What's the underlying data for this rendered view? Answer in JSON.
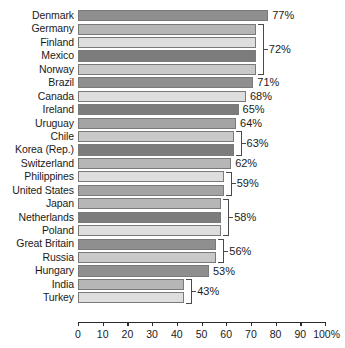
{
  "chart_data": {
    "type": "bar",
    "orientation": "horizontal",
    "title": "",
    "subtitle": "",
    "xlabel": "",
    "ylabel": "",
    "xlim": [
      0,
      100
    ],
    "grid": false,
    "legend": null,
    "unit": "%",
    "xticks": [
      0,
      10,
      20,
      30,
      40,
      50,
      60,
      70,
      80,
      90,
      100
    ],
    "xticklabels": [
      "0",
      "10",
      "20",
      "30",
      "40",
      "50",
      "60",
      "70",
      "80",
      "90",
      "100%"
    ],
    "categories": [
      "Denmark",
      "Germany",
      "Finland",
      "Mexico",
      "Norway",
      "Brazil",
      "Canada",
      "Ireland",
      "Uruguay",
      "Chile",
      "Korea (Rep.)",
      "Switzerland",
      "Philippines",
      "United States",
      "Japan",
      "Netherlands",
      "Poland",
      "Great Britain",
      "Russia",
      "Hungary",
      "India",
      "Turkey"
    ],
    "values": [
      77,
      72,
      72,
      72,
      72,
      71,
      68,
      65,
      64,
      63,
      63,
      62,
      59,
      59,
      58,
      58,
      58,
      56,
      56,
      53,
      43,
      43
    ],
    "bars": [
      {
        "country": "Denmark",
        "value": 77,
        "value_label": "77%",
        "shade": "sA"
      },
      {
        "country": "Germany",
        "value": 72,
        "value_label": "",
        "shade": "sB"
      },
      {
        "country": "Finland",
        "value": 72,
        "value_label": "",
        "shade": "sC"
      },
      {
        "country": "Mexico",
        "value": 72,
        "value_label": "",
        "shade": "sD"
      },
      {
        "country": "Norway",
        "value": 72,
        "value_label": "",
        "shade": "sE"
      },
      {
        "country": "Brazil",
        "value": 71,
        "value_label": "71%",
        "shade": "sA"
      },
      {
        "country": "Canada",
        "value": 68,
        "value_label": "68%",
        "shade": "sC"
      },
      {
        "country": "Ireland",
        "value": 65,
        "value_label": "65%",
        "shade": "sD"
      },
      {
        "country": "Uruguay",
        "value": 64,
        "value_label": "64%",
        "shade": "sF"
      },
      {
        "country": "Chile",
        "value": 63,
        "value_label": "",
        "shade": "sE"
      },
      {
        "country": "Korea (Rep.)",
        "value": 63,
        "value_label": "",
        "shade": "sD"
      },
      {
        "country": "Switzerland",
        "value": 62,
        "value_label": "62%",
        "shade": "sB"
      },
      {
        "country": "Philippines",
        "value": 59,
        "value_label": "",
        "shade": "sC"
      },
      {
        "country": "United States",
        "value": 59,
        "value_label": "",
        "shade": "sF"
      },
      {
        "country": "Japan",
        "value": 58,
        "value_label": "",
        "shade": "sB"
      },
      {
        "country": "Netherlands",
        "value": 58,
        "value_label": "",
        "shade": "sD"
      },
      {
        "country": "Poland",
        "value": 58,
        "value_label": "",
        "shade": "sC"
      },
      {
        "country": "Great Britain",
        "value": 56,
        "value_label": "",
        "shade": "sA"
      },
      {
        "country": "Russia",
        "value": 56,
        "value_label": "",
        "shade": "sE"
      },
      {
        "country": "Hungary",
        "value": 53,
        "value_label": "53%",
        "shade": "sA"
      },
      {
        "country": "India",
        "value": 43,
        "value_label": "",
        "shade": "sB"
      },
      {
        "country": "Turkey",
        "value": 43,
        "value_label": "",
        "shade": "sC"
      }
    ],
    "grouped_value_labels": [
      {
        "label": "77%",
        "value": 77,
        "start_row": 0,
        "end_row": 0,
        "bracket": false
      },
      {
        "label": "72%",
        "value": 72,
        "start_row": 1,
        "end_row": 4,
        "bracket": true
      },
      {
        "label": "71%",
        "value": 71,
        "start_row": 5,
        "end_row": 5,
        "bracket": false
      },
      {
        "label": "68%",
        "value": 68,
        "start_row": 6,
        "end_row": 6,
        "bracket": false
      },
      {
        "label": "65%",
        "value": 65,
        "start_row": 7,
        "end_row": 7,
        "bracket": false
      },
      {
        "label": "64%",
        "value": 64,
        "start_row": 8,
        "end_row": 8,
        "bracket": false
      },
      {
        "label": "63%",
        "value": 63,
        "start_row": 9,
        "end_row": 10,
        "bracket": true
      },
      {
        "label": "62%",
        "value": 62,
        "start_row": 11,
        "end_row": 11,
        "bracket": false
      },
      {
        "label": "59%",
        "value": 59,
        "start_row": 12,
        "end_row": 13,
        "bracket": true
      },
      {
        "label": "58%",
        "value": 58,
        "start_row": 14,
        "end_row": 16,
        "bracket": true
      },
      {
        "label": "56%",
        "value": 56,
        "start_row": 17,
        "end_row": 18,
        "bracket": true
      },
      {
        "label": "53%",
        "value": 53,
        "start_row": 19,
        "end_row": 19,
        "bracket": false
      },
      {
        "label": "43%",
        "value": 43,
        "start_row": 20,
        "end_row": 21,
        "bracket": true
      }
    ],
    "colors": {
      "sA": "#8f8f8f",
      "sB": "#b6b6b6",
      "sC": "#dedede",
      "sD": "#7c7c7c",
      "sE": "#c9c9c9",
      "sF": "#a4a4a4",
      "bar_border": "#7a7a7a",
      "axis": "#2b2b2b",
      "bracket": "#4a4a4a",
      "text": "#1a1a1a",
      "background": "#ffffff"
    }
  }
}
